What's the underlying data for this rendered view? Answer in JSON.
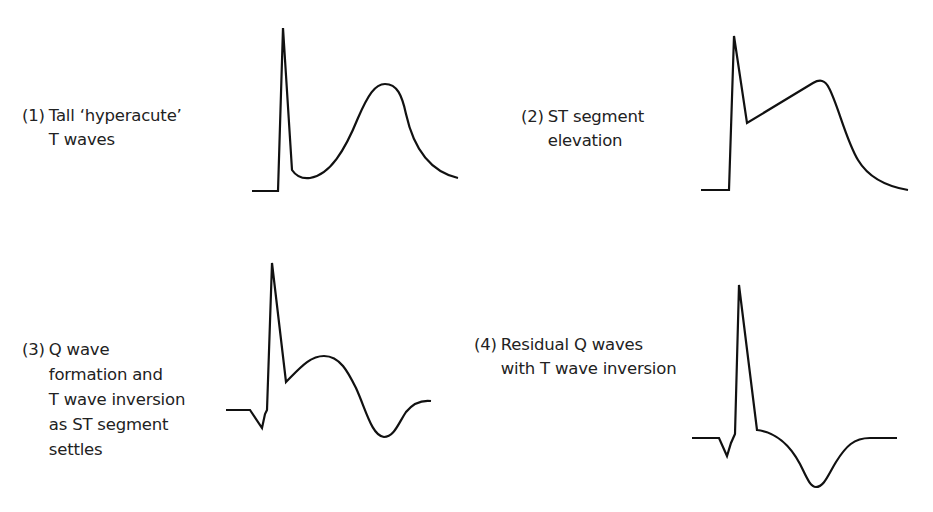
{
  "diagram": {
    "type": "ecg-evolution-stages",
    "stroke_color": "#111111",
    "text_color": "#222222",
    "background": "#ffffff",
    "panels": [
      {
        "number": "(1)",
        "lines": [
          "Tall ‘hyperacute’",
          "T waves"
        ],
        "waveform": "hyperacute-t-wave"
      },
      {
        "number": "(2)",
        "lines": [
          "ST segment",
          "elevation"
        ],
        "waveform": "st-elevation"
      },
      {
        "number": "(3)",
        "lines": [
          "Q wave",
          "formation and",
          "T wave inversion",
          "as ST segment",
          "settles"
        ],
        "waveform": "q-wave-t-inversion"
      },
      {
        "number": "(4)",
        "lines": [
          "Residual Q waves",
          "with T wave inversion"
        ],
        "waveform": "residual-q-t-inversion"
      }
    ]
  }
}
